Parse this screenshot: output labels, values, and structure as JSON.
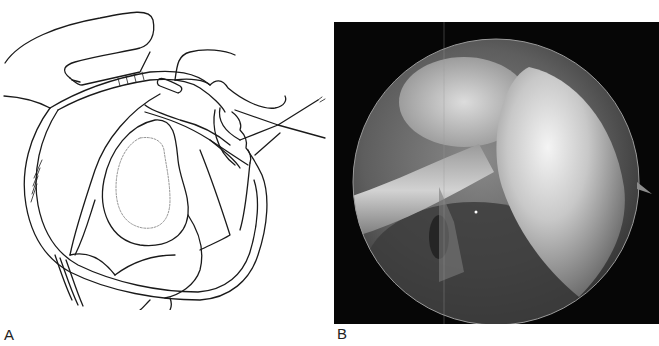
{
  "figure": {
    "panels": [
      {
        "id": "A",
        "label": "A",
        "type": "line-drawing",
        "subject": "shoulder-arthroscopy-illustration"
      },
      {
        "id": "B",
        "label": "B",
        "type": "arthroscopic-photo",
        "subject": "arthroscopic-view-circular"
      }
    ]
  }
}
